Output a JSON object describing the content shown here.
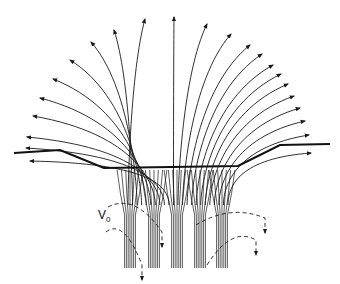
{
  "diagram": {
    "label_v": "V",
    "label_v_sub": "0",
    "colors": {
      "line": "#1a1a1a",
      "background": "#ffffff"
    },
    "surface": [
      [
        14,
        153
      ],
      [
        60,
        150
      ],
      [
        104,
        168
      ],
      [
        238,
        166
      ],
      [
        280,
        145
      ],
      [
        330,
        144
      ]
    ],
    "field_lines_left_tips": [
      [
        145,
        19
      ],
      [
        114,
        30
      ],
      [
        91,
        42
      ],
      [
        70,
        60
      ],
      [
        53,
        79
      ],
      [
        40,
        98
      ],
      [
        33,
        116
      ],
      [
        27,
        137
      ],
      [
        26,
        148
      ],
      [
        30,
        161
      ]
    ],
    "field_lines_right_tips": [
      [
        174,
        17
      ],
      [
        207,
        24
      ],
      [
        231,
        34
      ],
      [
        250,
        45
      ],
      [
        262,
        54
      ],
      [
        273,
        65
      ],
      [
        281,
        74
      ],
      [
        288,
        84
      ],
      [
        294,
        96
      ],
      [
        300,
        108
      ],
      [
        305,
        121
      ],
      [
        309,
        135
      ],
      [
        311,
        153
      ]
    ],
    "bundles_x": [
      130,
      154,
      177,
      200,
      222
    ],
    "dashed_loops": [
      {
        "from": [
          108,
          207
        ],
        "to": [
          162,
          232
        ],
        "arrow": "start"
      },
      {
        "from": [
          106,
          232
        ],
        "to": [
          142,
          265
        ],
        "arrow": "end"
      },
      {
        "from": [
          196,
          225
        ],
        "to": [
          265,
          218
        ],
        "arrow": "mid"
      },
      {
        "from": [
          207,
          265
        ],
        "to": [
          256,
          240
        ],
        "arrow": "mid"
      }
    ]
  }
}
